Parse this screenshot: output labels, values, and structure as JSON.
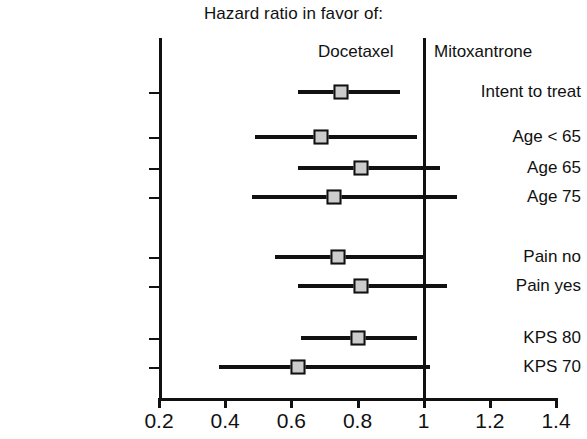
{
  "header": {
    "title": "Hazard ratio in favor of:",
    "left_group": "Docetaxel",
    "right_group": "Mitoxantrone"
  },
  "axis": {
    "x_ticks": [
      "0.2",
      "0.4",
      "0.6",
      "0.8",
      "1",
      "1.2",
      "1.4"
    ],
    "x_tick_values": [
      0.2,
      0.4,
      0.6,
      0.8,
      1.0,
      1.2,
      1.4
    ],
    "x_min": 0.2,
    "x_max": 1.4,
    "reference_line": 1.0
  },
  "colors": {
    "axis": "#111111",
    "marker_fill": "#cccccc",
    "marker_edge": "#111111",
    "background": "#ffffff"
  },
  "chart_data": {
    "type": "scatter",
    "title": "Hazard ratio in favor of:",
    "xlabel": "",
    "ylabel": "",
    "xlim": [
      0.2,
      1.4
    ],
    "grid": false,
    "legend": null,
    "subtitle_left": "Docetaxel",
    "subtitle_right": "Mitoxantrone",
    "reference_line": 1.0,
    "xticks": [
      0.2,
      0.4,
      0.6,
      0.8,
      1.0,
      1.2,
      1.4
    ],
    "xticklabels": [
      "0.2",
      "0.4",
      "0.6",
      "0.8",
      "1",
      "1.2",
      "1.4"
    ],
    "categories": [
      "Intent to treat",
      "Age < 65",
      "Age 65",
      "Age 75",
      "Pain no",
      "Pain yes",
      "KPS 80",
      "KPS 70"
    ],
    "values": [
      0.75,
      0.69,
      0.81,
      0.73,
      0.74,
      0.81,
      0.8,
      0.62
    ],
    "ci_low": [
      0.62,
      0.49,
      0.62,
      0.48,
      0.55,
      0.62,
      0.63,
      0.38
    ],
    "ci_high": [
      0.93,
      0.98,
      1.05,
      1.1,
      1.0,
      1.07,
      0.98,
      1.02
    ],
    "rows": [
      {
        "label": "Intent to treat",
        "hr": 0.75,
        "low": 0.62,
        "high": 0.93,
        "y": 92
      },
      {
        "label": "Age < 65",
        "hr": 0.69,
        "low": 0.49,
        "high": 0.98,
        "y": 137
      },
      {
        "label": "Age 65",
        "hr": 0.81,
        "low": 0.62,
        "high": 1.05,
        "y": 168
      },
      {
        "label": "Age 75",
        "hr": 0.73,
        "low": 0.48,
        "high": 1.1,
        "y": 197
      },
      {
        "label": "Pain no",
        "hr": 0.74,
        "low": 0.55,
        "high": 1.0,
        "y": 257
      },
      {
        "label": "Pain yes",
        "hr": 0.81,
        "low": 0.62,
        "high": 1.07,
        "y": 286
      },
      {
        "label": "KPS 80",
        "hr": 0.8,
        "low": 0.63,
        "high": 0.98,
        "y": 338
      },
      {
        "label": "KPS 70",
        "hr": 0.62,
        "low": 0.38,
        "high": 1.02,
        "y": 367
      }
    ]
  }
}
